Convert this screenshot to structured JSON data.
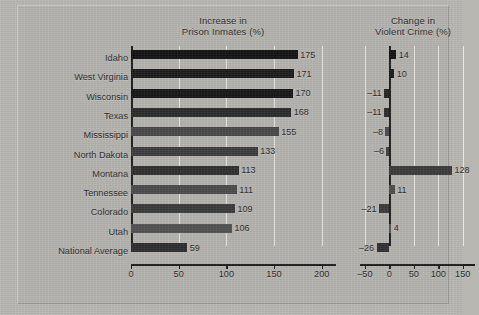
{
  "figure": {
    "background_color": "#b5b3ae",
    "plate_border_color": "#9c9a95"
  },
  "chart_data": [
    {
      "id": "prison",
      "type": "bar",
      "orientation": "horizontal",
      "title": "Increase in\nPrison Inmates (%)",
      "title_line1": "Increase in",
      "title_line2": "Prison Inmates (%)",
      "xlabel": "",
      "ylabel": "",
      "xlim": [
        0,
        215
      ],
      "xticks": [
        0,
        50,
        100,
        150,
        200
      ],
      "xticklabels": [
        "0",
        "50",
        "100",
        "150",
        "200"
      ],
      "grid": true,
      "grid_color": "#e7e5e0",
      "categories": [
        "Idaho",
        "West Virginia",
        "Wisconsin",
        "Texas",
        "Mississippi",
        "North Dakota",
        "Montana",
        "Tennessee",
        "Colorado",
        "Utah",
        "National Average"
      ],
      "values": [
        175,
        171,
        170,
        168,
        155,
        133,
        113,
        111,
        109,
        106,
        59
      ],
      "data_labels": [
        "175",
        "171",
        "170",
        "168",
        "155",
        "133",
        "113",
        "111",
        "109",
        "106",
        "59"
      ],
      "bar_colors": [
        "#121212",
        "#1b1b1b",
        "#161616",
        "#2a2a2a",
        "#474747",
        "#3c3c3c",
        "#2e2e2e",
        "#4a4a4a",
        "#3a3a3a",
        "#515151",
        "#2d2d2d"
      ]
    },
    {
      "id": "violent-crime",
      "type": "bar",
      "orientation": "horizontal",
      "title": "Change in\nViolent Crime (%)",
      "title_line1": "Change in",
      "title_line2": "Violent Crime (%)",
      "xlabel": "",
      "ylabel": "",
      "xlim": [
        -60,
        175
      ],
      "xticks": [
        -50,
        0,
        50,
        100,
        150
      ],
      "xticklabels": [
        "–50",
        "0",
        "50",
        "100",
        "150"
      ],
      "grid": true,
      "grid_color": "#e7e5e0",
      "categories": [
        "Idaho",
        "West Virginia",
        "Wisconsin",
        "Texas",
        "Mississippi",
        "North Dakota",
        "Montana",
        "Tennessee",
        "Colorado",
        "Utah",
        "National Average"
      ],
      "values": [
        14,
        10,
        -11,
        -11,
        -8,
        -6,
        128,
        11,
        -21,
        4,
        -26
      ],
      "data_labels": [
        "14",
        "10",
        "–11",
        "–11",
        "–8",
        "–6",
        "128",
        "11",
        "–21",
        "4",
        "–26"
      ],
      "bar_colors": [
        "#121212",
        "#1b1b1b",
        "#232323",
        "#2b2b2b",
        "#4b4b4b",
        "#3f3f3f",
        "#3a3a3a",
        "#4d4d4d",
        "#3b3b3b",
        "#555555",
        "#2f2f2f"
      ]
    }
  ]
}
